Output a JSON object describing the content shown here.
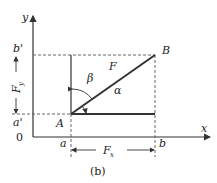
{
  "diagram": {
    "caption": "(b)",
    "axes": {
      "x_label": "x",
      "y_label": "y",
      "origin_label": "0"
    },
    "points": {
      "A": "A",
      "B": "B"
    },
    "ticks": {
      "a": "a",
      "b": "b",
      "a_prime": "a'",
      "b_prime": "b'"
    },
    "vector": {
      "label": "F"
    },
    "components": {
      "fx": "F",
      "fx_sub": "x",
      "fy": "F",
      "fy_sub": "y"
    },
    "angles": {
      "alpha": "α",
      "beta": "β"
    },
    "colors": {
      "line": "#333333",
      "dash": "#555555"
    }
  }
}
